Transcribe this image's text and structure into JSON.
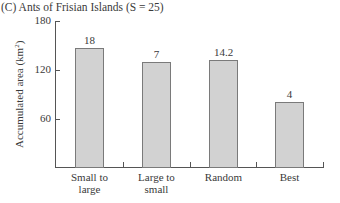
{
  "chart_data": {
    "type": "bar",
    "title": "(C) Ants of Frisian Islands (S = 25)",
    "xlabel": "",
    "ylabel": "Accumulated area (km²)",
    "ylabel_main": "Accumulated area (km",
    "ylabel_sup": "2",
    "ylabel_end": ")",
    "ylim": [
      0,
      180
    ],
    "yticks": [
      60,
      120,
      180
    ],
    "grid": false,
    "legend": null,
    "categories": [
      "Small to large",
      "Large to small",
      "Random",
      "Best"
    ],
    "category_lines": [
      [
        "Small to",
        "large"
      ],
      [
        "Large to",
        "small"
      ],
      [
        "Random",
        ""
      ],
      [
        "Best",
        ""
      ]
    ],
    "values": [
      147,
      130,
      132,
      81
    ],
    "annotations": [
      "18",
      "7",
      "14.2",
      "4"
    ],
    "bar_color": "#d2d2d2",
    "bar_edge_color": "#7a7a7a"
  }
}
